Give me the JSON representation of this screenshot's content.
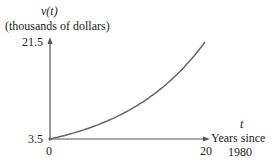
{
  "chart_data": {
    "type": "line",
    "title": "",
    "ylabel_var": "v(t)",
    "ylabel": "(thousands of dollars)",
    "xlabel_var": "t",
    "xlabel_line1": "Years since",
    "xlabel_line2": "1980",
    "xlim": [
      0,
      20
    ],
    "ylim": [
      3.5,
      21.5
    ],
    "x_ticks": [
      "0",
      "20"
    ],
    "y_ticks": [
      "3.5",
      "21.5"
    ],
    "grid": false,
    "legend": null,
    "series": [
      {
        "name": "v(t)",
        "model": "exponential",
        "x": [
          0,
          2,
          4,
          6,
          8,
          10,
          12,
          14,
          16,
          18,
          20
        ],
        "values": [
          3.5,
          4.2,
          5.0,
          6.0,
          7.2,
          8.7,
          10.4,
          12.5,
          15.0,
          17.9,
          21.5
        ]
      }
    ],
    "colors": {
      "axis": "#555555",
      "curve": "#666666"
    }
  }
}
